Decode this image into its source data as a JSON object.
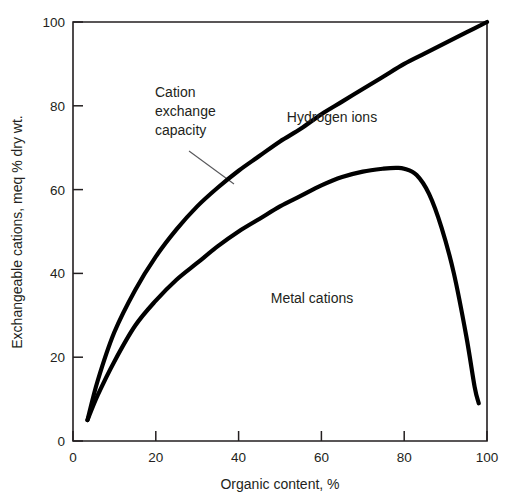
{
  "chart_data": {
    "type": "line",
    "title": "",
    "subtitle": "",
    "xlabel": "Organic content, %",
    "ylabel": "Exchangeable cations, meq % dry wt.",
    "xlim": [
      0,
      100
    ],
    "ylim": [
      0,
      100
    ],
    "xticks": [
      0,
      20,
      40,
      60,
      80,
      100
    ],
    "yticks": [
      0,
      20,
      40,
      60,
      80,
      100
    ],
    "xtick_labels": [
      "0",
      "20",
      "40",
      "60",
      "80",
      "100"
    ],
    "ytick_labels": [
      "0",
      "20",
      "40",
      "60",
      "80",
      "100"
    ],
    "grid": false,
    "legend_position": "inline-annotations",
    "series": [
      {
        "name": "Cation exchange capacity",
        "label_text": "Cation exchange capacity",
        "label_lines": [
          "Cation",
          "exchange",
          "capacity"
        ],
        "color": "#000000",
        "x": [
          3.5,
          6,
          10,
          15,
          20,
          25,
          30,
          35,
          40,
          45,
          50,
          55,
          60,
          65,
          70,
          75,
          80,
          85,
          90,
          95,
          100
        ],
        "y": [
          5,
          14.5,
          26,
          36,
          44,
          50.5,
          56,
          60.5,
          64.5,
          68,
          71.5,
          74.5,
          78,
          81,
          84,
          87,
          90,
          92.5,
          95,
          97.5,
          100
        ]
      },
      {
        "name": "Metal cations",
        "label_text": "Metal cations",
        "color": "#000000",
        "x": [
          3.5,
          6,
          10,
          15,
          20,
          25,
          30,
          35,
          40,
          45,
          50,
          55,
          60,
          65,
          70,
          75,
          78,
          80,
          83,
          86,
          89,
          92,
          95,
          97,
          98
        ],
        "y": [
          5,
          11,
          19,
          27.5,
          33.5,
          38.5,
          42.5,
          46.5,
          50,
          53,
          56,
          58.5,
          61,
          63,
          64.3,
          65,
          65.2,
          65,
          63.5,
          59,
          51,
          40,
          25,
          13,
          9
        ]
      }
    ],
    "annotations": [
      {
        "name": "cation-exchange-capacity-annotation",
        "text_lines": [
          "Cation",
          "exchange",
          "capacity"
        ],
        "leader_from": [
          28,
          78.5
        ],
        "leader_to": [
          38.5,
          63.5
        ]
      },
      {
        "name": "hydrogen-ions-annotation",
        "text": "Hydrogen ions",
        "position": [
          62,
          79
        ]
      },
      {
        "name": "metal-cations-annotation",
        "text": "Metal cations",
        "position": [
          53,
          30
        ]
      }
    ],
    "colors": {
      "curve": "#000000",
      "axis": "#231f20",
      "leader": "#58585b",
      "background": "#ffffff"
    }
  }
}
